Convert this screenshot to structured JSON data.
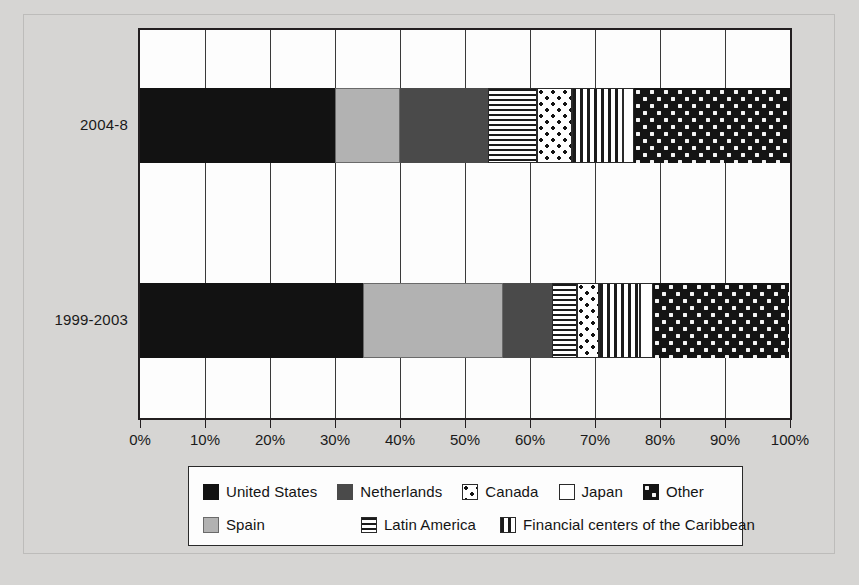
{
  "chart_data": {
    "type": "bar",
    "orientation": "horizontal",
    "stacked": true,
    "stack_mode": "percent",
    "title": "",
    "xlabel": "",
    "ylabel": "",
    "xlim": [
      0,
      100
    ],
    "grid": true,
    "legend_position": "bottom",
    "categories": [
      "1999-2003",
      "2004-8"
    ],
    "category_order_top_to_bottom": [
      "2004-8",
      "1999-2003"
    ],
    "x_tick_labels": [
      "0%",
      "10%",
      "20%",
      "30%",
      "40%",
      "50%",
      "60%",
      "70%",
      "80%",
      "90%",
      "100%"
    ],
    "x_tick_values": [
      0,
      10,
      20,
      30,
      40,
      50,
      60,
      70,
      80,
      90,
      100
    ],
    "series": [
      {
        "name": "United States",
        "pattern": "solid-black",
        "color": "#121212",
        "values": [
          34.3,
          30.0
        ]
      },
      {
        "name": "Spain",
        "pattern": "solid-light-gray",
        "color": "#b2b2b2",
        "values": [
          21.6,
          10.0
        ]
      },
      {
        "name": "Netherlands",
        "pattern": "solid-dark-gray",
        "color": "#4a4a4a",
        "values": [
          7.5,
          13.5
        ]
      },
      {
        "name": "Latin America",
        "pattern": "horizontal-stripes",
        "color": "#1b1b1b",
        "values": [
          3.8,
          7.5
        ]
      },
      {
        "name": "Canada",
        "pattern": "dots-on-white",
        "color": "#ffffff",
        "values": [
          3.4,
          5.4
        ]
      },
      {
        "name": "Financial centers of the Caribbean",
        "pattern": "vertical-stripes",
        "color": "#1b1b1b",
        "values": [
          6.4,
          7.9
        ]
      },
      {
        "name": "Japan",
        "pattern": "white",
        "color": "#ffffff",
        "values": [
          2.0,
          1.7
        ]
      },
      {
        "name": "Other",
        "pattern": "checker-dots-on-black",
        "color": "#141414",
        "values": [
          20.9,
          24.0
        ]
      }
    ],
    "cumulative_boundaries": {
      "2004-8": [
        30.0,
        40.0,
        53.5,
        61.0,
        66.4,
        74.3,
        76.0,
        100.0
      ],
      "1999-2003": [
        34.3,
        55.9,
        63.4,
        67.2,
        70.6,
        77.0,
        79.0,
        100.0
      ]
    }
  },
  "axis": {
    "y_labels": [
      "2004-8",
      "1999-2003"
    ],
    "x_labels": [
      "0%",
      "10%",
      "20%",
      "30%",
      "40%",
      "50%",
      "60%",
      "70%",
      "80%",
      "90%",
      "100%"
    ]
  },
  "legend": {
    "row1": [
      {
        "label": "United States",
        "swatch": "solid-black"
      },
      {
        "label": "Netherlands",
        "swatch": "solid-dark-gray"
      },
      {
        "label": "Canada",
        "swatch": "dots-on-white"
      },
      {
        "label": "Japan",
        "swatch": "white"
      },
      {
        "label": "Other",
        "swatch": "checker-dots-on-black"
      }
    ],
    "row2": [
      {
        "label": "Spain",
        "swatch": "solid-light-gray"
      },
      {
        "label": "Latin America",
        "swatch": "horizontal-stripes"
      },
      {
        "label": "Financial centers of the Caribbean",
        "swatch": "vertical-stripes"
      }
    ]
  },
  "colors": {
    "page_background": "#d6d5d3",
    "plot_background": "#fdfdfd",
    "axis_line": "#231f20",
    "gridline": "#3a3a3a",
    "text": "#1a1a1a"
  }
}
